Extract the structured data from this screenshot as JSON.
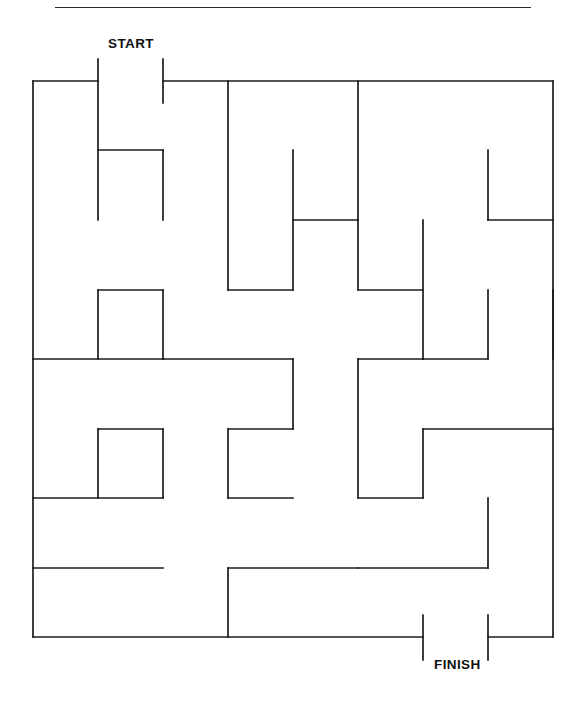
{
  "page": {
    "background_color": "#ffffff",
    "wall_color": "#1c1c1c",
    "text_color": "#111111"
  },
  "header": {
    "clipped_title_descender": "Maze Puzzle Page",
    "rule_visible": true
  },
  "maze": {
    "title_start": "START",
    "title_finish": "FINISH",
    "cols": 8,
    "rows": 8,
    "cell_width": 65,
    "cell_height": 69.5,
    "origin_x": 33,
    "origin_y": 81,
    "entrance": {
      "label": "START",
      "edge": "top",
      "from_col": 1,
      "to_col": 2
    },
    "exit": {
      "label": "FINISH",
      "edge": "bottom",
      "from_col": 6,
      "to_col": 7
    },
    "walls": [
      [
        33,
        81,
        98,
        81
      ],
      [
        163,
        81,
        553,
        81
      ],
      [
        33,
        81,
        33,
        637
      ],
      [
        553,
        81,
        553,
        637
      ],
      [
        33,
        637,
        423,
        637
      ],
      [
        488,
        637,
        553,
        637
      ],
      [
        98,
        59,
        98,
        220
      ],
      [
        163,
        59,
        163,
        103
      ],
      [
        228,
        81,
        228,
        290
      ],
      [
        358,
        81,
        358,
        220
      ],
      [
        98,
        150,
        163,
        150
      ],
      [
        163,
        150,
        163,
        220
      ],
      [
        293,
        150,
        293,
        290
      ],
      [
        488,
        150,
        488,
        220
      ],
      [
        488,
        220,
        553,
        220
      ],
      [
        293,
        220,
        358,
        220
      ],
      [
        358,
        220,
        358,
        290
      ],
      [
        228,
        290,
        293,
        290
      ],
      [
        358,
        290,
        423,
        290
      ],
      [
        423,
        220,
        423,
        359
      ],
      [
        98,
        290,
        163,
        290
      ],
      [
        98,
        290,
        98,
        359
      ],
      [
        163,
        290,
        163,
        359
      ],
      [
        488,
        290,
        488,
        359
      ],
      [
        553,
        290,
        553,
        359
      ],
      [
        33,
        359,
        163,
        359
      ],
      [
        163,
        359,
        293,
        359
      ],
      [
        293,
        359,
        293,
        429
      ],
      [
        358,
        359,
        423,
        359
      ],
      [
        358,
        359,
        358,
        498
      ],
      [
        423,
        359,
        488,
        359
      ],
      [
        98,
        429,
        163,
        429
      ],
      [
        98,
        429,
        98,
        498
      ],
      [
        163,
        429,
        163,
        498
      ],
      [
        228,
        429,
        293,
        429
      ],
      [
        228,
        429,
        228,
        498
      ],
      [
        228,
        498,
        293,
        498
      ],
      [
        423,
        429,
        423,
        498
      ],
      [
        423,
        429,
        553,
        429
      ],
      [
        33,
        498,
        163,
        498
      ],
      [
        358,
        498,
        423,
        498
      ],
      [
        488,
        498,
        488,
        568
      ],
      [
        33,
        568,
        163,
        568
      ],
      [
        228,
        568,
        358,
        568
      ],
      [
        228,
        568,
        228,
        637
      ],
      [
        358,
        568,
        488,
        568
      ],
      [
        423,
        615,
        423,
        660
      ],
      [
        488,
        615,
        488,
        660
      ]
    ]
  }
}
